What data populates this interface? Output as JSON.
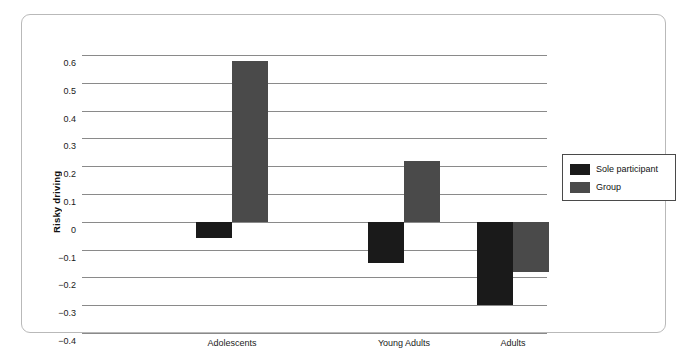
{
  "chart_data": {
    "type": "bar",
    "title": "",
    "xlabel": "",
    "ylabel": "Risky driving",
    "categories": [
      "Adolescents",
      "Young Adults",
      "Adults"
    ],
    "series": [
      {
        "name": "Sole participant",
        "color": "#1a1a1a",
        "values": [
          -0.06,
          -0.15,
          -0.3
        ]
      },
      {
        "name": "Group",
        "color": "#4a4a4a",
        "values": [
          0.58,
          0.22,
          -0.18
        ]
      }
    ],
    "ylim": [
      -0.4,
      0.6
    ],
    "ytick_values": [
      0.6,
      0.5,
      0.4,
      0.3,
      0.2,
      0.1,
      0,
      -0.1,
      -0.2,
      -0.3,
      -0.4
    ],
    "ytick_labels": [
      "0.6",
      "0.5",
      "0.4",
      "0.3",
      "0.2",
      "0.1",
      "0",
      "−0.1",
      "−0.2",
      "−0.3",
      "−0.4"
    ],
    "grid": true,
    "legend_position": "right"
  },
  "legend": {
    "entries": [
      {
        "label": "Sole participant",
        "color": "#1a1a1a"
      },
      {
        "label": "Group",
        "color": "#4a4a4a"
      }
    ]
  },
  "colors": {
    "sole_participant": "#1a1a1a",
    "group": "#4a4a4a",
    "gridline": "#8a8a8a",
    "frame": "#b9b9b9"
  }
}
